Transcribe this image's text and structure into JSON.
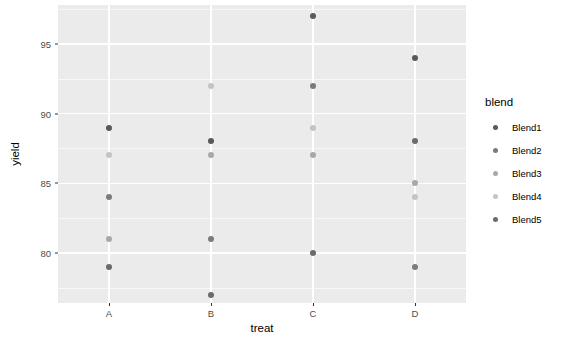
{
  "chart_data": {
    "type": "scatter",
    "title": "",
    "xlabel": "treat",
    "ylabel": "yield",
    "categories": [
      "A",
      "B",
      "C",
      "D"
    ],
    "xticklabels": [
      "A",
      "B",
      "C",
      "D"
    ],
    "yticklabels": [
      "80",
      "85",
      "90",
      "95"
    ],
    "yticks": [
      80,
      85,
      90,
      95
    ],
    "ylim": [
      76.4,
      97.8
    ],
    "grid": true,
    "grid_major_y": [
      80,
      85,
      90,
      95
    ],
    "grid_minor_y": [
      77.5,
      82.5,
      87.5,
      92.5,
      97.5
    ],
    "legend_position": "right",
    "legend_title": "blend",
    "panel_background": "#ebebeb",
    "grid_color": "#ffffff",
    "series": [
      {
        "name": "Blend1",
        "color": "#595959",
        "points": [
          {
            "x": "A",
            "y": 89
          },
          {
            "x": "B",
            "y": 88
          },
          {
            "x": "C",
            "y": 97
          },
          {
            "x": "D",
            "y": 94
          }
        ]
      },
      {
        "name": "Blend2",
        "color": "#7b7b7b",
        "points": [
          {
            "x": "A",
            "y": 84
          },
          {
            "x": "B",
            "y": 81
          },
          {
            "x": "C",
            "y": 92
          },
          {
            "x": "D",
            "y": 79
          }
        ]
      },
      {
        "name": "Blend3",
        "color": "#a8a8a8",
        "points": [
          {
            "x": "A",
            "y": 81
          },
          {
            "x": "B",
            "y": 87
          },
          {
            "x": "C",
            "y": 87
          },
          {
            "x": "D",
            "y": 85
          }
        ]
      },
      {
        "name": "Blend4",
        "color": "#c4c4c4",
        "points": [
          {
            "x": "A",
            "y": 87
          },
          {
            "x": "B",
            "y": 92
          },
          {
            "x": "C",
            "y": 89
          },
          {
            "x": "D",
            "y": 84
          }
        ]
      },
      {
        "name": "Blend5",
        "color": "#6b6b6b",
        "points": [
          {
            "x": "A",
            "y": 79
          },
          {
            "x": "B",
            "y": 77
          },
          {
            "x": "C",
            "y": 80
          },
          {
            "x": "D",
            "y": 88
          }
        ]
      }
    ]
  },
  "legend": {
    "title": "blend",
    "entries": [
      {
        "label": "Blend1",
        "color": "#595959"
      },
      {
        "label": "Blend2",
        "color": "#7b7b7b"
      },
      {
        "label": "Blend3",
        "color": "#a8a8a8"
      },
      {
        "label": "Blend4",
        "color": "#c4c4c4"
      },
      {
        "label": "Blend5",
        "color": "#6b6b6b"
      }
    ]
  },
  "axes": {
    "x_title": "treat",
    "y_title": "yield"
  }
}
